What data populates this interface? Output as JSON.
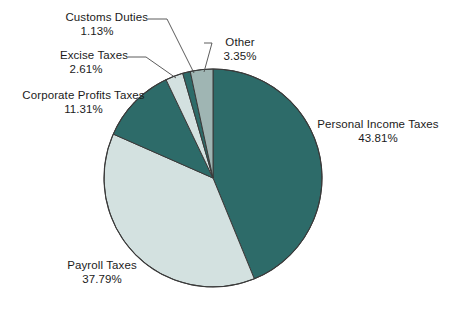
{
  "chart_data": {
    "type": "pie",
    "title": "",
    "subtitle": "",
    "xlabel": "",
    "ylabel": "",
    "legend_position": "callout-labels",
    "grid": false,
    "units": "percent",
    "start_angle_deg": -90,
    "direction": "clockwise",
    "categories": [
      "Personal Income Taxes",
      "Payroll Taxes",
      "Corporate Profits Taxes",
      "Excise Taxes",
      "Customs Duties",
      "Other"
    ],
    "values": [
      43.81,
      37.79,
      11.31,
      2.61,
      1.13,
      3.35
    ],
    "slices": [
      {
        "label": "Personal Income Taxes",
        "value": 43.81,
        "value_text": "43.81%",
        "color": "#2d6b69"
      },
      {
        "label": "Payroll Taxes",
        "value": 37.79,
        "value_text": "37.79%",
        "color": "#d3e1e0"
      },
      {
        "label": "Corporate Profits Taxes",
        "value": 11.31,
        "value_text": "11.31%",
        "color": "#2d6b69"
      },
      {
        "label": "Excise Taxes",
        "value": 2.61,
        "value_text": "2.61%",
        "color": "#d3e1e0"
      },
      {
        "label": "Customs Duties",
        "value": 1.13,
        "value_text": "1.13%",
        "color": "#2d6b69"
      },
      {
        "label": "Other",
        "value": 3.35,
        "value_text": "3.35%",
        "color": "#9fb5b3"
      }
    ]
  },
  "colors": {
    "dark_teal": "#2d6b69",
    "light_teal": "#d3e1e0",
    "mid_teal": "#9fb5b3",
    "outline": "#3a3a3a",
    "leader_line": "#4a4a4a",
    "text": "#1b1b1b",
    "background": "#ffffff"
  },
  "labels": {
    "personal_income": {
      "name": "Personal Income Taxes",
      "pct": "43.81%"
    },
    "payroll": {
      "name": "Payroll Taxes",
      "pct": "37.79%"
    },
    "corporate": {
      "name": "Corporate Profits Taxes",
      "pct": "11.31%"
    },
    "excise": {
      "name": "Excise Taxes",
      "pct": "2.61%"
    },
    "customs": {
      "name": "Customs Duties",
      "pct": "1.13%"
    },
    "other": {
      "name": "Other",
      "pct": "3.35%"
    }
  }
}
